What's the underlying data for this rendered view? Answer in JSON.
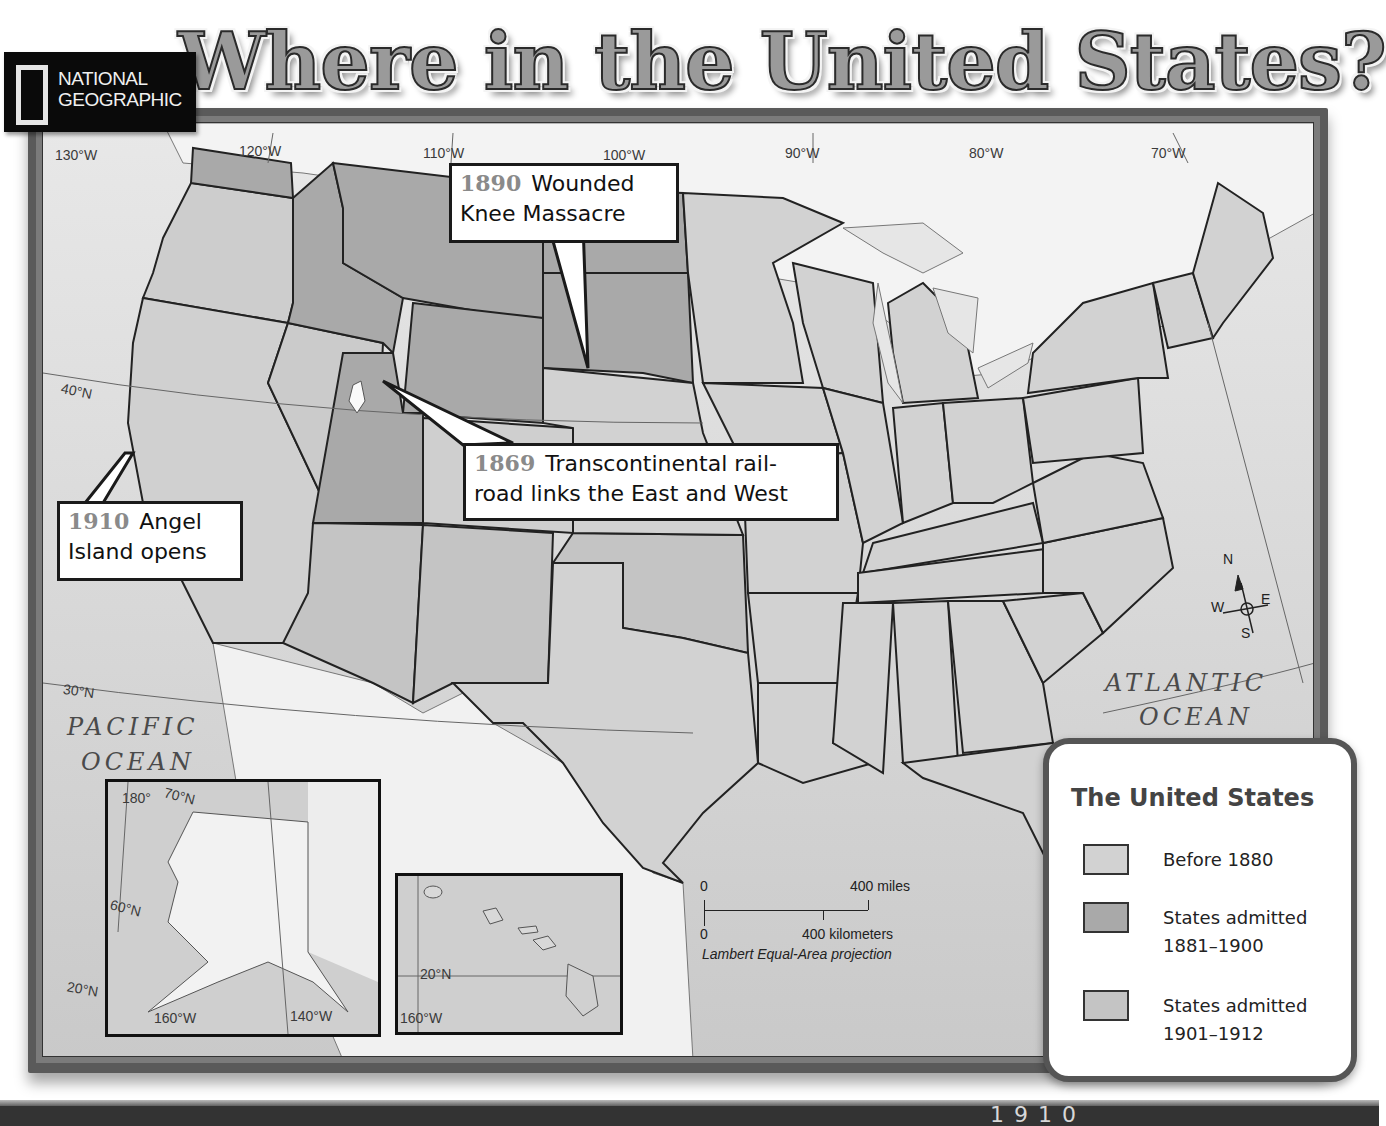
{
  "header": {
    "brand": "NATIONAL GEOGRAPHIC",
    "brand_line1": "NATIONAL",
    "brand_line2": "GEOGRAPHIC",
    "title": "Where in the United States?"
  },
  "map": {
    "longitude_labels": [
      "130°W",
      "120°W",
      "110°W",
      "100°W",
      "90°W",
      "80°W",
      "70°W"
    ],
    "latitude_labels": [
      "40°N",
      "30°N"
    ],
    "oceans": {
      "pacific_line1": "PACIFIC",
      "pacific_line2": "OCEAN",
      "atlantic_line1": "ATLANTIC",
      "atlantic_line2": "OCEAN"
    },
    "compass": {
      "n": "N",
      "s": "S",
      "e": "E",
      "w": "W"
    },
    "callouts": [
      {
        "year": "1890",
        "text_line1": "Wounded",
        "text_line2": "Knee Massacre"
      },
      {
        "year": "1869",
        "text_line1": "Transcontinental rail-",
        "text_line2": "road links the East and West"
      },
      {
        "year": "1910",
        "text_line1": "Angel",
        "text_line2": "Island opens"
      }
    ],
    "scale": {
      "miles_zero": "0",
      "miles_label": "400 miles",
      "km_zero": "0",
      "km_label": "400 kilometers",
      "projection": "Lambert Equal-Area projection"
    },
    "insets": {
      "alaska": {
        "labels": [
          "180°",
          "70°N",
          "60°N",
          "20°N",
          "160°W",
          "140°W"
        ]
      },
      "hawaii": {
        "labels": [
          "20°N",
          "160°W"
        ]
      }
    }
  },
  "legend": {
    "title": "The United States",
    "items": [
      {
        "label": "Before 1880",
        "color": "#d2d2d2"
      },
      {
        "label": "States admitted 1881–1900",
        "color": "#a9a9a9"
      },
      {
        "label": "States admitted 1901–1912",
        "color": "#c4c4c4"
      }
    ]
  },
  "colors": {
    "before_1880": "#d2d2d2",
    "admitted_1881_1900": "#a9a9a9",
    "admitted_1901_1912": "#c4c4c4",
    "foreign_land": "#f2f2f2",
    "water": "#d6d6d6",
    "frame": "#5a5a5a"
  },
  "footer": {
    "partial_text": "1910"
  }
}
